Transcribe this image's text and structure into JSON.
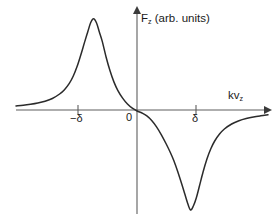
{
  "figure": {
    "background_color": "#ffffff",
    "curve_color": "#2b2b2b",
    "axis_color": "#5e5e5e",
    "text_color": "#1a1a1a"
  },
  "labels": {
    "ylabel_symbol": "F",
    "ylabel_subscript": "z",
    "ylabel_units": " (arb. units)",
    "xlabel_symbol": "kv",
    "xlabel_subscript": "z",
    "tick_neg_delta": "−δ",
    "tick_zero": "0",
    "tick_pos_delta": "δ"
  },
  "chart_data": {
    "type": "line",
    "title": "",
    "xlabel": "kv_z",
    "ylabel": "F_z (arb. units)",
    "grid": false,
    "legend": null,
    "xlim": [
      -2.6,
      2.6
    ],
    "ylim": [
      -1.12,
      1.0
    ],
    "xticks": [
      -1,
      0,
      1
    ],
    "xticklabels": [
      "−δ",
      "0",
      "δ"
    ],
    "yticks": [],
    "yticklabels": [],
    "model": {
      "form": "F(x) = A/(1+((x+d)/w)^2) - A/(1-((x-d)/w)^2*-1)",
      "peak_center": -1.0,
      "dip_center": 1.0,
      "halfwidth": 0.33,
      "peak_amplitude": 0.93,
      "dip_amplitude": -1.05
    },
    "series": [
      {
        "name": "F_z",
        "x": [
          -2.6,
          -2.45,
          -2.3,
          -2.15,
          -2.0,
          -1.85,
          -1.7,
          -1.6,
          -1.5,
          -1.42,
          -1.34,
          -1.26,
          -1.18,
          -1.12,
          -1.06,
          -1.0,
          -0.94,
          -0.88,
          -0.82,
          -0.74,
          -0.66,
          -0.58,
          -0.5,
          -0.4,
          -0.3,
          -0.2,
          -0.1,
          0.0,
          0.1,
          0.2,
          0.3,
          0.4,
          0.5,
          0.58,
          0.66,
          0.74,
          0.82,
          0.88,
          0.94,
          1.0,
          1.06,
          1.12,
          1.18,
          1.26,
          1.34,
          1.42,
          1.5,
          1.6,
          1.7,
          1.85,
          2.0,
          2.15,
          2.3,
          2.45,
          2.6
        ],
        "y": [
          0.04,
          0.047,
          0.057,
          0.07,
          0.088,
          0.115,
          0.16,
          0.203,
          0.266,
          0.337,
          0.434,
          0.555,
          0.686,
          0.78,
          0.872,
          0.912,
          0.872,
          0.78,
          0.686,
          0.528,
          0.392,
          0.281,
          0.197,
          0.119,
          0.06,
          0.018,
          -0.01,
          -0.03,
          -0.058,
          -0.104,
          -0.168,
          -0.248,
          -0.34,
          -0.42,
          -0.51,
          -0.62,
          -0.74,
          -0.835,
          -0.93,
          -1.0,
          -0.96,
          -0.88,
          -0.77,
          -0.62,
          -0.49,
          -0.388,
          -0.31,
          -0.24,
          -0.19,
          -0.14,
          -0.108,
          -0.086,
          -0.07,
          -0.058,
          -0.048
        ]
      }
    ]
  },
  "geometry": {
    "axis_y_px": 110,
    "axis_x_px": 137,
    "x_left_px": 16,
    "x_right_px": 268,
    "y_top_px": 10,
    "y_bottom_px": 214,
    "tick_neg_px": 78,
    "tick_pos_px": 196
  }
}
